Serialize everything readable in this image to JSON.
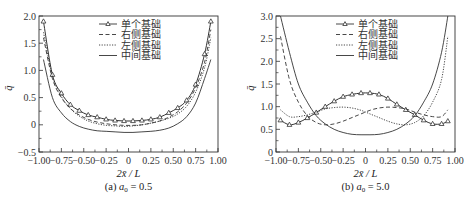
{
  "chart_data": [
    {
      "type": "line",
      "panel": "a",
      "caption": "(a) a0 = 0.5",
      "caption_prefix": "(a) ",
      "caption_var": "a",
      "caption_sub": "0",
      "caption_value": " = 0.5",
      "title": "",
      "xlabel": "2x̄ / L",
      "ylabel": "q̄",
      "xlim": [
        -1.0,
        1.0
      ],
      "ylim": [
        -0.5,
        2.0
      ],
      "xticks": [
        "-1.00",
        "-0.75",
        "-0.50",
        "-0.25",
        "0",
        "0.25",
        "0.50",
        "0.75",
        "1.00"
      ],
      "yticks": [
        "-0.5",
        "0",
        "0.5",
        "1.0",
        "1.5",
        "2.0"
      ],
      "grid": false,
      "legend_position": "upper center",
      "legend": [
        "单个基础",
        "右侧基础",
        "左侧基础",
        "中间基础"
      ],
      "x": [
        -0.95,
        -0.85,
        -0.75,
        -0.65,
        -0.55,
        -0.45,
        -0.35,
        -0.25,
        -0.15,
        -0.05,
        0.05,
        0.15,
        0.25,
        0.35,
        0.45,
        0.55,
        0.65,
        0.75,
        0.85,
        0.92
      ],
      "series": [
        {
          "name": "单个基础",
          "style": "solid-triangle",
          "values": [
            1.9,
            0.92,
            0.58,
            0.37,
            0.26,
            0.18,
            0.14,
            0.1,
            0.08,
            0.07,
            0.07,
            0.08,
            0.1,
            0.14,
            0.22,
            0.31,
            0.45,
            0.74,
            1.3,
            1.9
          ]
        },
        {
          "name": "右侧基础",
          "style": "dashed",
          "values": [
            1.6,
            0.85,
            0.5,
            0.3,
            0.18,
            0.1,
            0.05,
            0.02,
            0.0,
            -0.01,
            -0.01,
            0.0,
            0.03,
            0.07,
            0.14,
            0.24,
            0.4,
            0.68,
            1.15,
            1.75
          ]
        },
        {
          "name": "左侧基础",
          "style": "dotted",
          "values": [
            1.7,
            0.9,
            0.52,
            0.3,
            0.16,
            0.07,
            0.02,
            -0.01,
            -0.02,
            -0.03,
            -0.02,
            0.0,
            0.03,
            0.07,
            0.12,
            0.2,
            0.34,
            0.6,
            1.05,
            1.6
          ]
        },
        {
          "name": "中间基础",
          "style": "solid",
          "values": [
            1.2,
            0.5,
            0.22,
            0.06,
            -0.03,
            -0.08,
            -0.11,
            -0.12,
            -0.13,
            -0.14,
            -0.14,
            -0.13,
            -0.12,
            -0.1,
            -0.06,
            0.02,
            0.15,
            0.4,
            0.85,
            1.2
          ]
        }
      ]
    },
    {
      "type": "line",
      "panel": "b",
      "caption": "(b) a0 = 5.0",
      "caption_prefix": "(b) ",
      "caption_var": "a",
      "caption_sub": "0",
      "caption_value": " = 5.0",
      "title": "",
      "xlabel": "2x̄ / L",
      "ylabel": "q̄",
      "xlim": [
        -1.0,
        1.0
      ],
      "ylim": [
        0,
        3.0
      ],
      "xticks": [
        "-1.00",
        "-0.75",
        "-0.50",
        "-0.25",
        "0",
        "0.25",
        "0.50",
        "0.75",
        "1.00"
      ],
      "yticks": [
        "0",
        "0.5",
        "1.0",
        "1.5",
        "2.0",
        "2.5",
        "3.0"
      ],
      "grid": false,
      "legend_position": "upper center",
      "legend": [
        "单个基础",
        "右侧基础",
        "左侧基础",
        "中间基础"
      ],
      "x": [
        -0.95,
        -0.85,
        -0.75,
        -0.65,
        -0.55,
        -0.45,
        -0.35,
        -0.25,
        -0.15,
        -0.05,
        0.05,
        0.15,
        0.25,
        0.35,
        0.45,
        0.55,
        0.65,
        0.75,
        0.85,
        0.92
      ],
      "series": [
        {
          "name": "单个基础",
          "style": "solid-triangle",
          "values": [
            0.7,
            0.6,
            0.65,
            0.75,
            0.87,
            1.0,
            1.12,
            1.22,
            1.27,
            1.3,
            1.3,
            1.27,
            1.18,
            1.05,
            0.93,
            0.82,
            0.7,
            0.62,
            0.62,
            0.68
          ]
        },
        {
          "name": "右侧基础",
          "style": "dashed",
          "values": [
            2.55,
            1.6,
            1.1,
            0.8,
            0.65,
            0.6,
            0.62,
            0.68,
            0.76,
            0.84,
            0.92,
            0.97,
            0.99,
            0.98,
            0.95,
            0.88,
            0.82,
            0.78,
            0.78,
            0.93
          ]
        },
        {
          "name": "左侧基础",
          "style": "dotted",
          "values": [
            0.93,
            0.78,
            0.78,
            0.82,
            0.88,
            0.95,
            0.98,
            0.99,
            0.97,
            0.92,
            0.84,
            0.76,
            0.68,
            0.62,
            0.6,
            0.65,
            0.8,
            1.1,
            1.6,
            2.55
          ]
        },
        {
          "name": "中间基础",
          "style": "solid",
          "values": [
            3.0,
            2.2,
            1.5,
            1.1,
            0.8,
            0.62,
            0.5,
            0.43,
            0.39,
            0.38,
            0.38,
            0.39,
            0.43,
            0.5,
            0.62,
            0.8,
            1.1,
            1.5,
            2.2,
            3.0
          ]
        }
      ]
    }
  ]
}
